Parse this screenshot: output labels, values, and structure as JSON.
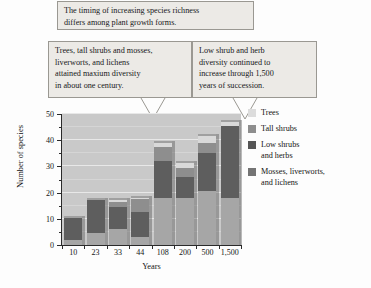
{
  "callouts": {
    "top": {
      "lines": [
        "The timing of increasing species richness",
        "differs among plant growth forms."
      ]
    },
    "left": {
      "lines": [
        "Trees, tall shrubs and mosses,",
        "liverworts, and lichens",
        "attained maxium diversity",
        "in about one century."
      ]
    },
    "right": {
      "lines": [
        "Low shrub and herb",
        "diversity continued to",
        "increase through 1,500",
        "years of succession."
      ]
    }
  },
  "legend": {
    "items": [
      {
        "label_lines": [
          "Trees"
        ],
        "color": "#dcdcdc"
      },
      {
        "label_lines": [
          "Tall shrubs"
        ],
        "color": "#8e8e8e"
      },
      {
        "label_lines": [
          "Low shrubs",
          "and herbs"
        ],
        "color": "#555555"
      },
      {
        "label_lines": [
          "Mosses, liverworts,",
          "and lichens"
        ],
        "color": "#747474"
      }
    ]
  },
  "chart_data": {
    "type": "bar",
    "title": "",
    "xlabel": "Years",
    "ylabel": "Number of species",
    "categories": [
      "10",
      "23",
      "33",
      "44",
      "108",
      "200",
      "500",
      "1,500"
    ],
    "ylim": [
      0,
      50
    ],
    "yticks": [
      0,
      10,
      20,
      30,
      40,
      50
    ],
    "yminorticks": [
      5,
      15,
      25,
      35,
      45
    ],
    "grid": true,
    "stacked": true,
    "legend_position": "right",
    "series": [
      {
        "name": "Mosses, liverworts, and lichens",
        "color": "#a6a6a6",
        "values": [
          2,
          4.5,
          6,
          3,
          18,
          18,
          20.5,
          18
        ]
      },
      {
        "name": "Low shrubs and herbs",
        "color": "#5e5e5e",
        "values": [
          8.5,
          12.5,
          8.5,
          9.5,
          14,
          8,
          14.5,
          27.5
        ]
      },
      {
        "name": "Tall shrubs",
        "color": "#8e8e8e",
        "values": [
          0,
          0,
          2,
          5,
          5.5,
          3.5,
          4,
          0
        ]
      },
      {
        "name": "Trees",
        "color": "#d9d9d9",
        "values": [
          0,
          0,
          0.5,
          0.5,
          1.5,
          2,
          2.5,
          1.5
        ]
      }
    ],
    "totals": [
      10.5,
      17,
      17,
      18,
      39,
      31.5,
      41.5,
      47
    ]
  }
}
